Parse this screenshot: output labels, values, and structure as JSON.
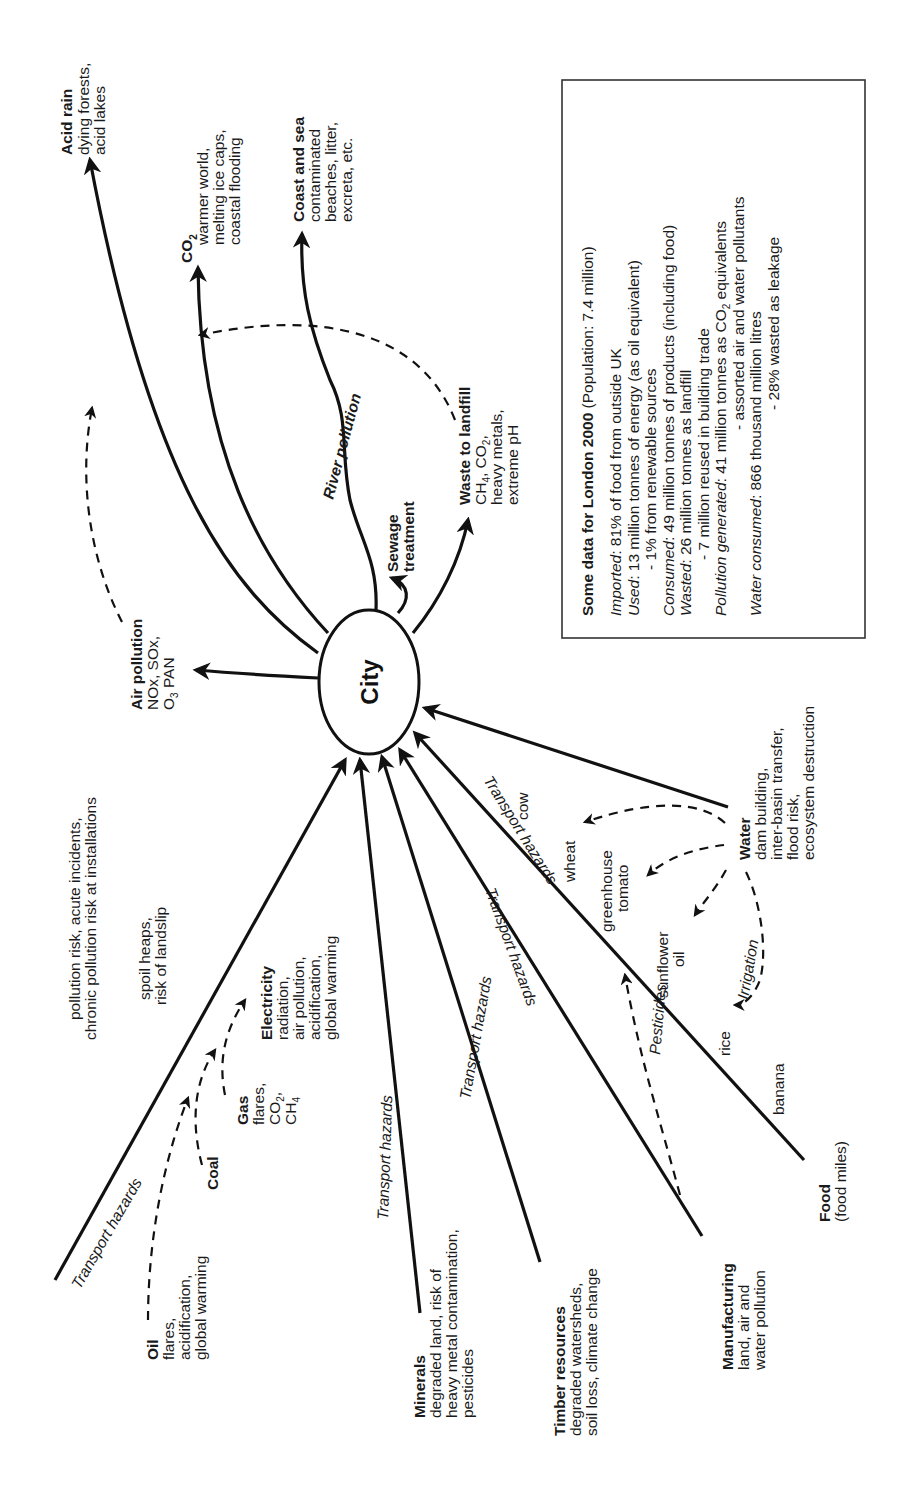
{
  "diagram": {
    "center": {
      "label": "City"
    },
    "outputs": {
      "acid_rain": {
        "title": "Acid rain",
        "lines": [
          "dying forests,",
          "acid lakes"
        ]
      },
      "co2": {
        "title": "CO",
        "title_sub": "2",
        "lines": [
          "warmer world,",
          "melting ice caps,",
          "coastal flooding"
        ]
      },
      "coast_sea": {
        "title": "Coast and sea",
        "lines": [
          "contaminated",
          "beaches, litter,",
          "excreta, etc."
        ]
      },
      "air_pollution": {
        "title": "Air pollution",
        "line1": "NOx, SOx,",
        "line2_pre": "O",
        "line2_sub": "3",
        "line2_post": " PAN"
      },
      "sewage": {
        "line1": "Sewage",
        "line2": "treatment"
      },
      "river": {
        "label": "River pollution"
      },
      "landfill": {
        "title": "Waste to landfill",
        "line1_a": "CH",
        "line1_a_sub": "4",
        "line1_b": ", CO",
        "line1_b_sub": "2",
        "line1_c": ",",
        "line2": "heavy metals,",
        "line3": "extreme pH"
      }
    },
    "inputs": {
      "energy_risk": {
        "line1": "pollution risk, acute incidents,",
        "line2": "chronic pollution risk at installations"
      },
      "coal_note": {
        "line1": "spoil heaps,",
        "line2": "risk of landslip"
      },
      "oil": {
        "title": "Oil",
        "lines": [
          "flares,",
          "acidification,",
          "global warming"
        ]
      },
      "coal": {
        "title": "Coal"
      },
      "gas": {
        "title": "Gas",
        "line1": "flares,",
        "line2_pre": "CO",
        "line2_sub": "2",
        "line2_post": ",",
        "line3_pre": "CH",
        "line3_sub": "4"
      },
      "electricity": {
        "title": "Electricity",
        "lines": [
          "radiation,",
          "air pollution,",
          "acidification,",
          "global warming"
        ]
      },
      "minerals": {
        "title": "Minerals",
        "lines": [
          "degraded land, risk of",
          "heavy metal contamination,",
          "pesticides"
        ]
      },
      "timber": {
        "title": "Timber resources",
        "lines": [
          "degraded watersheds,",
          "soil loss, climate change"
        ]
      },
      "manufacturing": {
        "title": "Manufacturing",
        "lines": [
          "land, air and",
          "water pollution"
        ]
      },
      "food": {
        "title": "Food",
        "subtitle": "(food miles)"
      },
      "water": {
        "title": "Water",
        "lines": [
          "dam building,",
          "inter-basin transfer,",
          "flood risk,",
          "ecosystem destruction"
        ]
      },
      "transport_hazards": "Transport hazards",
      "pesticides": "Pesticides",
      "irrigation": "Irrigation",
      "crops": {
        "cow": "cow",
        "wheat": "wheat",
        "greenhouse": "greenhouse",
        "tomato": "tomato",
        "sunflower": "sunflower",
        "oil": "oil",
        "rice": "rice",
        "banana": "banana"
      }
    },
    "info_box": {
      "title": "Some data for London 2000",
      "title_suffix": " (Population: 7.4 million)",
      "rows": [
        {
          "label": "Imported",
          "text": ": 81% of food from outside UK"
        },
        {
          "label": "Used",
          "text": ": 13 million tonnes of energy (as oil equivalent)"
        },
        {
          "label": "",
          "text": "- 1% from renewable sources"
        },
        {
          "label": "Consumed",
          "text": ": 49 million tonnes of products (including food)"
        },
        {
          "label": "Wasted",
          "text": ": 26 million tonnes as landfill"
        },
        {
          "label": "",
          "text": "- 7 million reused in building trade"
        },
        {
          "label": "Pollution generated",
          "text": ": 41 million tonnes as CO",
          "sub": "2",
          "text_after": " equivalents"
        },
        {
          "label": "",
          "text": "- assorted air and water pollutants"
        },
        {
          "label": "Water consumed",
          "text": ": 866 thousand million litres"
        },
        {
          "label": "",
          "text": "- 28% wasted as leakage"
        }
      ]
    }
  }
}
